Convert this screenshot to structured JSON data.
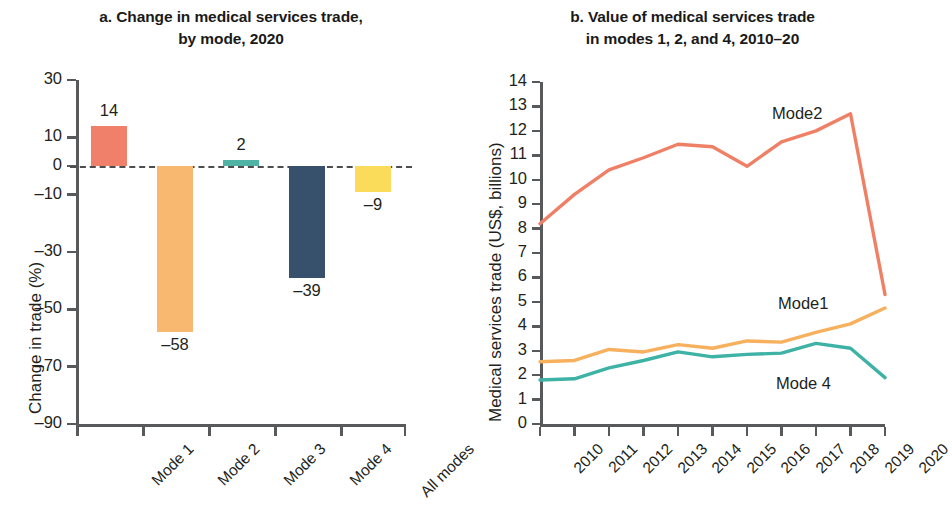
{
  "figure": {
    "panel_a_title_line1": "a. Change in medical services trade,",
    "panel_a_title_line2": "by mode, 2020",
    "panel_b_title_line1": "b. Value of medical services trade",
    "panel_b_title_line2": "in modes 1, 2, and 4, 2010–20"
  },
  "colors": {
    "mode1": "#f0806a",
    "mode2": "#f9b870",
    "mode3": "#4fb3a5",
    "mode4": "#37506b",
    "all_modes": "#fbdc5a",
    "line_mode2": "#ef8066",
    "line_mode1": "#f7b05e",
    "line_mode4": "#3eb2a4",
    "axis": "#58595b",
    "zero_line": "#4d4d4d"
  },
  "chart_data": [
    {
      "type": "bar",
      "title": "a. Change in medical services trade, by mode, 2020",
      "xlabel": "",
      "ylabel": "Change in trade (%)",
      "categories": [
        "Mode 1",
        "Mode 2",
        "Mode 3",
        "Mode 4",
        "All modes"
      ],
      "values": [
        14,
        -58,
        2,
        -39,
        -9
      ],
      "value_labels": [
        "14",
        "–58",
        "2",
        "–39",
        "–9"
      ],
      "ylim": [
        -90,
        30
      ],
      "yticks": [
        30,
        10,
        0,
        -10,
        -30,
        -50,
        -70,
        -90
      ],
      "ytick_labels": [
        "30",
        "10",
        "0",
        "–10",
        "–30",
        "–50",
        "–70",
        "–90"
      ],
      "grid": false,
      "legend": "none",
      "zero_reference_line": true
    },
    {
      "type": "line",
      "title": "b. Value of medical services trade in modes 1, 2, and 4, 2010–20",
      "xlabel": "",
      "ylabel": "Medical services trade (US$, billions)",
      "x": [
        "2010",
        "2011",
        "2012",
        "2013",
        "2014",
        "2015",
        "2016",
        "2017",
        "2018",
        "2019",
        "2020"
      ],
      "series": [
        {
          "name": "Mode2",
          "values": [
            8.2,
            9.4,
            10.4,
            10.9,
            11.45,
            11.35,
            10.55,
            11.55,
            12.0,
            12.7,
            5.3
          ]
        },
        {
          "name": "Mode1",
          "values": [
            2.55,
            2.6,
            3.05,
            2.95,
            3.25,
            3.1,
            3.4,
            3.35,
            3.75,
            4.1,
            4.75
          ]
        },
        {
          "name": "Mode 4",
          "values": [
            1.8,
            1.85,
            2.3,
            2.6,
            2.95,
            2.75,
            2.85,
            2.9,
            3.3,
            3.1,
            1.9
          ]
        }
      ],
      "ylim": [
        0,
        14
      ],
      "yticks": [
        0,
        1,
        2,
        3,
        4,
        5,
        6,
        7,
        8,
        9,
        10,
        11,
        12,
        13,
        14
      ],
      "ytick_labels": [
        "0",
        "1",
        "2",
        "3",
        "4",
        "5",
        "6",
        "7",
        "8",
        "9",
        "10",
        "11",
        "12",
        "13",
        "14"
      ],
      "grid": false,
      "legend": "inline-labels",
      "legend_entries": [
        "Mode2",
        "Mode1",
        "Mode 4"
      ]
    }
  ]
}
